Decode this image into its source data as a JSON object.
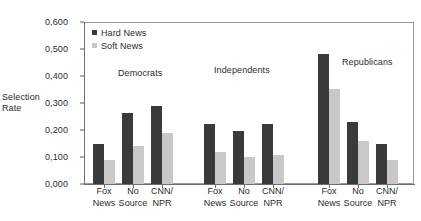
{
  "chart_data": {
    "type": "bar",
    "title": "",
    "subtitle": "",
    "xlabel": "",
    "ylabel": "Selection Rate",
    "ylabel_line1": "Selection",
    "ylabel_line2": "Rate",
    "ylim": [
      0.0,
      0.6
    ],
    "ytick_values": [
      0.6,
      0.5,
      0.4,
      0.3,
      0.2,
      0.1,
      0.0
    ],
    "ytick_labels": [
      "0,600",
      "0,500",
      "0,400",
      "0,300",
      "0,200",
      "0,100",
      "0,000"
    ],
    "decimal_separator": ",",
    "grid": false,
    "legend_position": "top-left",
    "legend": [
      {
        "name": "Hard News",
        "color": "#3a3a3a"
      },
      {
        "name": "Soft News",
        "color": "#c8c8c8"
      }
    ],
    "series": [
      {
        "name": "Hard News",
        "color": "#3a3a3a",
        "values": [
          0.148,
          0.263,
          0.289,
          0.222,
          0.196,
          0.222,
          0.481,
          0.23,
          0.148
        ]
      },
      {
        "name": "Soft News",
        "color": "#c8c8c8",
        "values": [
          0.089,
          0.141,
          0.189,
          0.119,
          0.1,
          0.107,
          0.352,
          0.159,
          0.089
        ]
      }
    ],
    "categories": [
      "Fox News",
      "No Source",
      "CNN/ NPR",
      "Fox News",
      "No Source",
      "CNN/ NPR",
      "Fox News",
      "No Source",
      "CNN/ NPR"
    ],
    "category_labels": [
      {
        "line1": "Fox",
        "line2": "News"
      },
      {
        "line1": "No",
        "line2": "Source"
      },
      {
        "line1": "CNN/",
        "line2": "NPR"
      },
      {
        "line1": "Fox",
        "line2": "News"
      },
      {
        "line1": "No",
        "line2": "Source"
      },
      {
        "line1": "CNN/",
        "line2": "NPR"
      },
      {
        "line1": "Fox",
        "line2": "News"
      },
      {
        "line1": "No",
        "line2": "Source"
      },
      {
        "line1": "CNN/",
        "line2": "NPR"
      }
    ],
    "groups": [
      {
        "label": "Democrats",
        "categories": [
          "Fox News",
          "No Source",
          "CNN/ NPR"
        ]
      },
      {
        "label": "Independents",
        "categories": [
          "Fox News",
          "No Source",
          "CNN/ NPR"
        ]
      },
      {
        "label": "Republicans",
        "categories": [
          "Fox News",
          "No Source",
          "CNN/ NPR"
        ]
      }
    ],
    "annotations": [
      {
        "text": "Democrats",
        "x": 118,
        "y": 68
      },
      {
        "text": "Independents",
        "x": 214,
        "y": 65
      },
      {
        "text": "Republicans",
        "x": 342,
        "y": 57
      }
    ]
  }
}
